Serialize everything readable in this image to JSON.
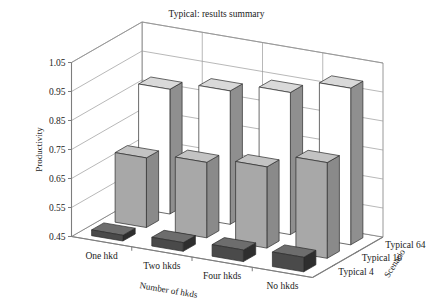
{
  "chart_data": {
    "type": "bar",
    "title": "Typical: results summary",
    "xlabel": "Number of hkds",
    "ylabel": "Productivity",
    "zlabel": "Scenario",
    "categories": [
      "One hkd",
      "Two hkds",
      "Four hkds",
      "No hkds"
    ],
    "depth_categories": [
      "Typical 4",
      "Typical 16",
      "Typical 64"
    ],
    "yticks": [
      "0.45",
      "0.55",
      "0.65",
      "0.75",
      "0.85",
      "0.95",
      "1.05"
    ],
    "ytick_values": [
      0.45,
      0.55,
      0.65,
      0.75,
      0.85,
      0.95,
      1.05
    ],
    "ylim": [
      0.45,
      1.05
    ],
    "grid": true,
    "legend": "none",
    "projection": "3d",
    "series": [
      {
        "name": "Typical 4",
        "values": [
          0.47,
          0.48,
          0.49,
          0.5
        ],
        "color": "#4a4a4a"
      },
      {
        "name": "Typical 16",
        "values": [
          0.69,
          0.71,
          0.73,
          0.78
        ],
        "color": "#a8a8a8"
      },
      {
        "name": "Typical 64",
        "values": [
          0.88,
          0.91,
          0.94,
          0.99
        ],
        "color": "#ffffff"
      }
    ]
  },
  "colors": {
    "axis": "#7d7d7d",
    "grid": "#9a9a9a",
    "text": "#1b1b1b",
    "bar_front_dark": "#4a4a4a",
    "bar_front_gray": "#a8a8a8",
    "bar_front_white": "#ffffff",
    "bar_top_dark": "#6d6d6d",
    "bar_top_gray": "#c3c3c3",
    "bar_top_white": "#d9d9d9",
    "bar_side_dark": "#2e2e2e",
    "bar_side_gray": "#8a8a8a",
    "bar_side_white": "#8f8f8f",
    "bar_edge": "#2b2b2b"
  }
}
